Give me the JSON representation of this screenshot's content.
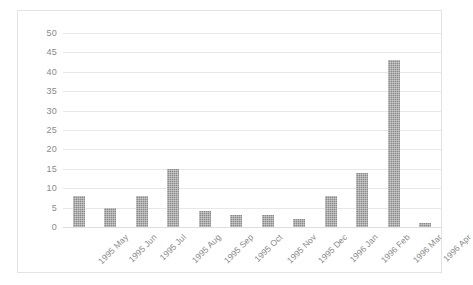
{
  "chart_data": {
    "type": "bar",
    "title": "",
    "subtitle": "",
    "xlabel": "",
    "ylabel": "",
    "categories": [
      "1995 May",
      "1995 Jun",
      "1995 Jul",
      "1995 Aug",
      "1995 Sep",
      "1995 Oct",
      "1995 Nov",
      "1995 Dec",
      "1996 Jan",
      "1996 Feb",
      "1996 Mar",
      "1996 Apr"
    ],
    "values": [
      8,
      5,
      8,
      15,
      4,
      3,
      3,
      2,
      8,
      14,
      43,
      1
    ],
    "ylim": [
      0,
      50
    ],
    "ytick_step": 5,
    "yticks": [
      0,
      5,
      10,
      15,
      20,
      25,
      30,
      35,
      40,
      45,
      50
    ],
    "ytick_labels": [
      "0",
      "5",
      "10",
      "15",
      "20",
      "25",
      "30",
      "35",
      "40",
      "45",
      "50"
    ],
    "grid": "horizontal",
    "legend": "none",
    "legend_entries": [],
    "annotations": [],
    "xtick_rotation_degrees": -45,
    "bar_color": "#8b8b8b",
    "gridline_color": "#e8e8e8",
    "axis_text_color": "#8a8a8a",
    "plot_background": "#ffffff",
    "frame_border_color": "#e3e3e3"
  }
}
